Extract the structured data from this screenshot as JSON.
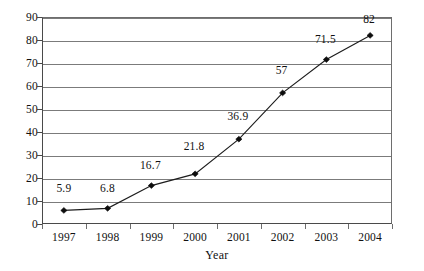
{
  "chart_data": {
    "type": "line",
    "title": "",
    "xlabel": "Year",
    "ylabel": "",
    "categories": [
      "1997",
      "1998",
      "1999",
      "2000",
      "2001",
      "2002",
      "2003",
      "2004"
    ],
    "values": [
      5.9,
      6.8,
      16.7,
      21.8,
      36.9,
      57,
      71.5,
      82
    ],
    "point_labels": [
      "5.9",
      "6.8",
      "16.7",
      "21.8",
      "36.9",
      "57",
      "71.5",
      "82"
    ],
    "ylim": [
      0,
      90
    ],
    "ytick_step": 10,
    "ytick_labels": [
      "90",
      "80",
      "70",
      "60",
      "50",
      "40",
      "30",
      "20",
      "10",
      "0"
    ],
    "grid": true,
    "legend": "none",
    "series": [
      {
        "name": "",
        "values": [
          5.9,
          6.8,
          16.7,
          21.8,
          36.9,
          57,
          71.5,
          82
        ]
      }
    ],
    "colors": {
      "line": "#1d1d1d",
      "marker": "#0d0d0d",
      "gridline": "#7b7b7b",
      "axis": "#4a4a4a",
      "text": "#111111",
      "background": "#ffffff"
    },
    "marker_shape": "diamond"
  }
}
